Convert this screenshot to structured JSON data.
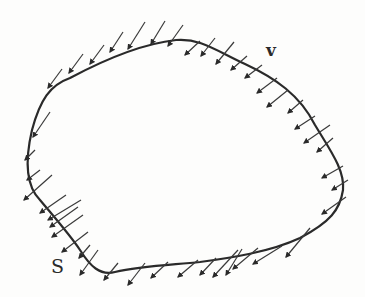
{
  "figure": {
    "type": "surface-with-velocity-vectors",
    "background": "#fdfdfc",
    "curve_color": "#2a2a2a",
    "arrow_color": "#3a3a3a"
  },
  "labels": {
    "vector_field": "v",
    "surface": "S"
  },
  "curve": {
    "name": "closed surface S",
    "path": "M 176 40 C 200 38, 215 50, 245 64 C 275 78, 300 95, 315 125 C 330 150, 345 170, 343 190 C 340 210, 330 222, 300 238 C 270 252, 230 258, 200 262 C 170 265, 140 266, 115 272 C 100 276, 90 266, 80 250 C 70 235, 55 218, 40 200 C 25 185, 25 160, 32 130 C 40 100, 50 85, 70 78 C 100 62, 140 44, 176 40 Z"
  },
  "arrows": [
    {
      "x1": 145,
      "y1": 22,
      "x2": 128,
      "y2": 49
    },
    {
      "x1": 165,
      "y1": 21,
      "x2": 151,
      "y2": 44
    },
    {
      "x1": 183,
      "y1": 25,
      "x2": 168,
      "y2": 46
    },
    {
      "x1": 123,
      "y1": 32,
      "x2": 110,
      "y2": 52
    },
    {
      "x1": 104,
      "y1": 45,
      "x2": 90,
      "y2": 64
    },
    {
      "x1": 83,
      "y1": 54,
      "x2": 69,
      "y2": 73
    },
    {
      "x1": 62,
      "y1": 69,
      "x2": 48,
      "y2": 88
    },
    {
      "x1": 50,
      "y1": 112,
      "x2": 33,
      "y2": 137
    },
    {
      "x1": 200,
      "y1": 41,
      "x2": 185,
      "y2": 55
    },
    {
      "x1": 215,
      "y1": 38,
      "x2": 201,
      "y2": 56
    },
    {
      "x1": 234,
      "y1": 42,
      "x2": 216,
      "y2": 64
    },
    {
      "x1": 247,
      "y1": 56,
      "x2": 231,
      "y2": 70
    },
    {
      "x1": 262,
      "y1": 65,
      "x2": 245,
      "y2": 78
    },
    {
      "x1": 277,
      "y1": 78,
      "x2": 257,
      "y2": 93
    },
    {
      "x1": 288,
      "y1": 90,
      "x2": 267,
      "y2": 107
    },
    {
      "x1": 303,
      "y1": 100,
      "x2": 288,
      "y2": 113
    },
    {
      "x1": 315,
      "y1": 116,
      "x2": 295,
      "y2": 129
    },
    {
      "x1": 330,
      "y1": 125,
      "x2": 304,
      "y2": 143
    },
    {
      "x1": 333,
      "y1": 138,
      "x2": 317,
      "y2": 152
    },
    {
      "x1": 343,
      "y1": 166,
      "x2": 322,
      "y2": 178
    },
    {
      "x1": 348,
      "y1": 180,
      "x2": 332,
      "y2": 190
    },
    {
      "x1": 346,
      "y1": 197,
      "x2": 322,
      "y2": 214
    },
    {
      "x1": 310,
      "y1": 228,
      "x2": 286,
      "y2": 257
    },
    {
      "x1": 282,
      "y1": 246,
      "x2": 253,
      "y2": 264
    },
    {
      "x1": 258,
      "y1": 248,
      "x2": 233,
      "y2": 269
    },
    {
      "x1": 242,
      "y1": 249,
      "x2": 226,
      "y2": 275
    },
    {
      "x1": 238,
      "y1": 250,
      "x2": 213,
      "y2": 277
    },
    {
      "x1": 216,
      "y1": 258,
      "x2": 200,
      "y2": 275
    },
    {
      "x1": 198,
      "y1": 260,
      "x2": 178,
      "y2": 277
    },
    {
      "x1": 168,
      "y1": 262,
      "x2": 151,
      "y2": 278
    },
    {
      "x1": 145,
      "y1": 263,
      "x2": 128,
      "y2": 285
    },
    {
      "x1": 118,
      "y1": 263,
      "x2": 104,
      "y2": 280
    },
    {
      "x1": 98,
      "y1": 250,
      "x2": 80,
      "y2": 275
    },
    {
      "x1": 90,
      "y1": 245,
      "x2": 79,
      "y2": 258
    },
    {
      "x1": 88,
      "y1": 232,
      "x2": 62,
      "y2": 252
    },
    {
      "x1": 83,
      "y1": 215,
      "x2": 52,
      "y2": 237
    },
    {
      "x1": 78,
      "y1": 207,
      "x2": 50,
      "y2": 227
    },
    {
      "x1": 81,
      "y1": 200,
      "x2": 48,
      "y2": 220
    },
    {
      "x1": 66,
      "y1": 195,
      "x2": 40,
      "y2": 213
    },
    {
      "x1": 52,
      "y1": 175,
      "x2": 24,
      "y2": 200
    },
    {
      "x1": 40,
      "y1": 170,
      "x2": 27,
      "y2": 180
    },
    {
      "x1": 35,
      "y1": 150,
      "x2": 25,
      "y2": 160
    }
  ]
}
